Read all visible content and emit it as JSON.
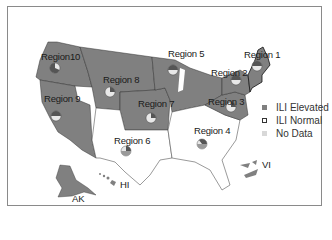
{
  "map": {
    "title": "",
    "regions": [
      {
        "id": "region-1",
        "label": "Region 1",
        "status": "ILI Elevated"
      },
      {
        "id": "region-2",
        "label": "Region 2",
        "status": "ILI Elevated"
      },
      {
        "id": "region-3",
        "label": "Region 3",
        "status": "ILI Elevated"
      },
      {
        "id": "region-4",
        "label": "Region 4",
        "status": "ILI Normal"
      },
      {
        "id": "region-5",
        "label": "Region 5",
        "status": "ILI Elevated"
      },
      {
        "id": "region-6",
        "label": "Region 6",
        "status": "ILI Normal"
      },
      {
        "id": "region-7",
        "label": "Region 7",
        "status": "ILI Elevated"
      },
      {
        "id": "region-8",
        "label": "Region 8",
        "status": "ILI Elevated"
      },
      {
        "id": "region-9",
        "label": "Region 9",
        "status": "ILI Elevated"
      },
      {
        "id": "region-10",
        "label": "Region10",
        "status": "ILI Elevated"
      }
    ],
    "territories": [
      {
        "id": "ak",
        "label": "AK",
        "status": "ILI Elevated"
      },
      {
        "id": "hi",
        "label": "HI",
        "status": "ILI Elevated"
      },
      {
        "id": "vi",
        "label": "VI",
        "status": "ILI Elevated"
      }
    ]
  },
  "legend": {
    "items": [
      {
        "label": "ILI Elevated",
        "color": "#808080"
      },
      {
        "label": "ILI Normal",
        "color": "#ffffff"
      },
      {
        "label": "No Data",
        "color": "#d8d8d8"
      }
    ]
  },
  "colors": {
    "elevated": "#808080",
    "normal": "#ffffff",
    "border": "#333333",
    "pie_dark": "#555555",
    "pie_light": "#e8e8e8",
    "pie_mid": "#9a9a9a"
  }
}
